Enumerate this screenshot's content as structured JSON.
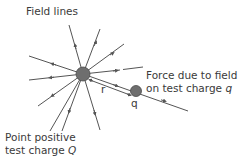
{
  "diagram": {
    "labels": {
      "field_lines": "Field lines",
      "force_line1": "Force due to field",
      "force_line2_prefix": "on test charge ",
      "force_line2_var": "q",
      "point_line1": "Point positive",
      "point_line2_prefix": "test charge ",
      "point_line2_var": "Q",
      "r": "r",
      "q": "q"
    },
    "colors": {
      "line": "#555555",
      "charge_fill": "#6e6e6e",
      "charge_stroke": "#4a4a4a",
      "text": "#3a3a3a"
    },
    "center_charge": {
      "cx": 83,
      "cy": 74,
      "r": 7
    },
    "test_charge": {
      "cx": 136,
      "cy": 91,
      "r": 5.5
    },
    "field_lines": [
      {
        "x2": 69,
        "y2": 25
      },
      {
        "x2": 100,
        "y2": 29
      },
      {
        "x2": 124,
        "y2": 44
      },
      {
        "x2": 118,
        "y2": 71
      },
      {
        "x2": 29,
        "y2": 56
      },
      {
        "x2": 29,
        "y2": 80
      },
      {
        "x2": 38,
        "y2": 106
      },
      {
        "x2": 50,
        "y2": 131
      },
      {
        "x2": 62,
        "y2": 131
      },
      {
        "x2": 100,
        "y2": 130
      },
      {
        "x2": 188,
        "y2": 111
      }
    ]
  }
}
